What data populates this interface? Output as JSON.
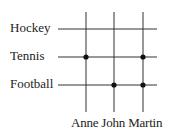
{
  "diagram": {
    "type": "grid-relation",
    "rows": [
      {
        "label": "Hockey",
        "y": 29
      },
      {
        "label": "Tennis",
        "y": 57
      },
      {
        "label": "Football",
        "y": 85
      }
    ],
    "columns": [
      {
        "label": "Anne",
        "x": 86
      },
      {
        "label": "John",
        "x": 114
      },
      {
        "label": "Martin",
        "x": 143
      }
    ],
    "marks": [
      {
        "row": "Tennis",
        "column": "Anne"
      },
      {
        "row": "Tennis",
        "column": "Martin"
      },
      {
        "row": "Football",
        "column": "John"
      },
      {
        "row": "Football",
        "column": "Martin"
      }
    ],
    "line_color": "#333333",
    "dot_color": "#111111"
  }
}
